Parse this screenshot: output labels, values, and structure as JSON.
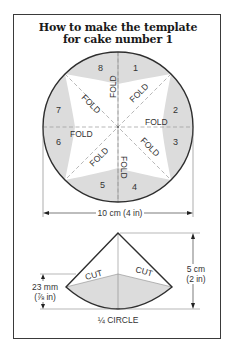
{
  "title": {
    "line1": "How to make the template",
    "line2": "for cake number 1"
  },
  "circle_diagram": {
    "segments": [
      "1",
      "2",
      "3",
      "4",
      "5",
      "6",
      "7",
      "8"
    ],
    "fold_label": "FOLD",
    "fold_labels": [
      "FOLD",
      "FOLD",
      "FOLD",
      "FOLD",
      "FOLD",
      "FOLD",
      "FOLD",
      "FOLD"
    ],
    "diameter_label": "10 cm (4 in)"
  },
  "quarter_diagram": {
    "cut_labels": [
      "CUT",
      "CUT"
    ],
    "height_label_line1": "5 cm",
    "height_label_line2": "(2 in)",
    "inner_label_line1": "23 mm",
    "inner_label_line2": "(⅞ in)",
    "caption": "¼ CIRCLE"
  },
  "colors": {
    "shade": "#dcdcdc",
    "line": "#2e2e2e",
    "dashed": "#9a9a9a"
  }
}
